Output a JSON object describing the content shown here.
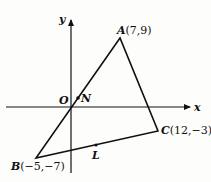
{
  "diagram": {
    "type": "coordinate-geometry-triangle",
    "axes": {
      "x_label": "x",
      "y_label": "y",
      "origin_label": "O"
    },
    "points": {
      "A": {
        "label": "A",
        "coords": "(7,9)",
        "x": 7,
        "y": 9
      },
      "B": {
        "label": "B",
        "coords": "(−5,−7)",
        "x": -5,
        "y": -7
      },
      "C": {
        "label": "C",
        "coords": "(12,−3)",
        "x": 12,
        "y": -3
      },
      "N": {
        "label": "N"
      },
      "L": {
        "label": "L"
      }
    },
    "segments": [
      "AB",
      "BC",
      "CA"
    ],
    "colors": {
      "ink": "#111111",
      "background": "#fdfdfb"
    }
  }
}
